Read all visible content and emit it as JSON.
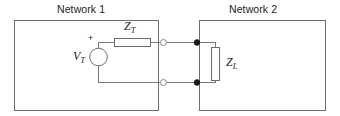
{
  "figure": {
    "background_color": "#ffffff",
    "line_color": "#6e6e6e",
    "wire_color": "#7a7a7a",
    "text_color": "#1c1c1c",
    "node_fill_color": "#1a1a1a",
    "terminal_fill_color": "#ffffff"
  },
  "networks": [
    {
      "id": "network-1",
      "label": "Network 1",
      "box": {
        "x": 14,
        "y": 20,
        "width": 144,
        "height": 90
      }
    },
    {
      "id": "network-2",
      "label": "Network 2",
      "box": {
        "x": 199,
        "y": 20,
        "width": 126,
        "height": 90
      }
    }
  ],
  "components": [
    {
      "id": "source-vt",
      "type": "voltage-source",
      "label": "V",
      "subscript": "T",
      "polarity_marker": "+",
      "center": {
        "x": 98,
        "y": 57
      },
      "radius": 9
    },
    {
      "id": "impedance-zt",
      "type": "impedance",
      "label": "Z",
      "subscript": "T",
      "orientation": "horizontal",
      "body": {
        "x": 114,
        "y": 38,
        "width": 37,
        "height": 9
      }
    },
    {
      "id": "impedance-zl",
      "type": "impedance",
      "label": "Z",
      "subscript": "L",
      "orientation": "vertical",
      "body": {
        "x": 211,
        "y": 47,
        "width": 9,
        "height": 34
      }
    }
  ],
  "terminals": [
    {
      "id": "terminal-top",
      "x": 163,
      "y": 42,
      "style": "open"
    },
    {
      "id": "terminal-bottom",
      "x": 163,
      "y": 82,
      "style": "open"
    }
  ],
  "nodes": [
    {
      "id": "node-top",
      "x": 197,
      "y": 42,
      "style": "filled"
    },
    {
      "id": "node-bottom",
      "x": 197,
      "y": 82,
      "style": "filled"
    }
  ],
  "wires": [
    {
      "id": "wire-source-top-to-zt",
      "from": {
        "x": 98,
        "y": 42
      },
      "to": {
        "x": 114,
        "y": 42
      }
    },
    {
      "id": "wire-zt-to-terminal-top",
      "from": {
        "x": 151,
        "y": 42
      },
      "to": {
        "x": 197,
        "y": 42
      }
    },
    {
      "id": "wire-source-bottom-to-terminal-bottom",
      "from": {
        "x": 98,
        "y": 82
      },
      "to": {
        "x": 197,
        "y": 82
      }
    },
    {
      "id": "wire-source-stub-top",
      "from": {
        "x": 98,
        "y": 42
      },
      "to": {
        "x": 98,
        "y": 48
      }
    },
    {
      "id": "wire-source-stub-bottom",
      "from": {
        "x": 98,
        "y": 66
      },
      "to": {
        "x": 98,
        "y": 82
      }
    },
    {
      "id": "wire-node-top-to-zl",
      "from": {
        "x": 197,
        "y": 42
      },
      "to": {
        "x": 215,
        "y": 42
      }
    },
    {
      "id": "wire-zl-top-lead",
      "from": {
        "x": 215,
        "y": 42
      },
      "to": {
        "x": 215,
        "y": 47
      }
    },
    {
      "id": "wire-zl-bottom-lead",
      "from": {
        "x": 215,
        "y": 81
      },
      "to": {
        "x": 215,
        "y": 82
      }
    },
    {
      "id": "wire-zl-to-node-bottom",
      "from": {
        "x": 197,
        "y": 82
      },
      "to": {
        "x": 215,
        "y": 82
      }
    }
  ],
  "labels": {
    "network_1_title": {
      "text": "Network 1",
      "x": 57,
      "y": 3
    },
    "network_2_title": {
      "text": "Network 2",
      "x": 229,
      "y": 3
    },
    "vt_label": {
      "x": 74,
      "y": 50
    },
    "zt_label": {
      "x": 124,
      "y": 20
    },
    "zl_label": {
      "x": 226,
      "y": 56
    },
    "plus_sign": {
      "text": "+",
      "x": 88,
      "y": 34
    }
  }
}
